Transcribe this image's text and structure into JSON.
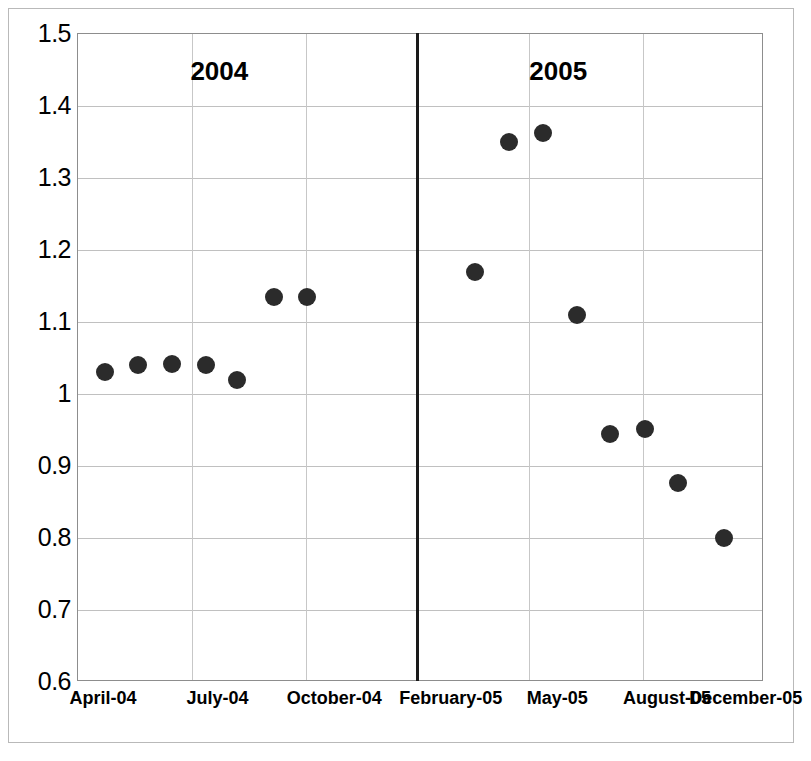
{
  "chart_data": {
    "type": "scatter",
    "title": "",
    "subtitle": "",
    "xlabel": "",
    "ylabel": "",
    "ylim": [
      0.6,
      1.5
    ],
    "ytick_step": 0.1,
    "yticks": [
      "1.5",
      "1.4",
      "1.3",
      "1.2",
      "1.1",
      "1",
      "0.9",
      "0.8",
      "0.7",
      "0.6"
    ],
    "ytick_values": [
      1.5,
      1.4,
      1.3,
      1.2,
      1.1,
      1.0,
      0.9,
      0.8,
      0.7,
      0.6
    ],
    "xticks": [
      "April-04",
      "July-04",
      "October-04",
      "February-05",
      "May-05",
      "August-05",
      "December-05"
    ],
    "xtick_positions": [
      0.038,
      0.205,
      0.375,
      0.545,
      0.7,
      0.86,
      0.975
    ],
    "grid": true,
    "legend": false,
    "legend_position": "none",
    "series": [
      {
        "name": "series-1",
        "x": [
          "April-04",
          "May-04",
          "June-04",
          "July-04",
          "August-04",
          "September-04",
          "October-04",
          "March-05",
          "April-05",
          "May-05",
          "June-05",
          "July-05",
          "August-05",
          "October-05",
          "December-05"
        ],
        "values": [
          1.03,
          1.04,
          1.042,
          1.04,
          1.02,
          1.135,
          1.135,
          1.17,
          1.35,
          1.362,
          1.11,
          0.945,
          0.952,
          0.877,
          0.8
        ],
        "x_fraction": [
          0.04,
          0.088,
          0.137,
          0.187,
          0.232,
          0.285,
          0.334,
          0.578,
          0.628,
          0.678,
          0.727,
          0.776,
          0.826,
          0.875,
          0.942
        ],
        "color": "#2b2b2b",
        "marker": "circle"
      }
    ],
    "annotations": [
      {
        "text": "2004",
        "x_fraction": 0.206,
        "y_value": 1.445,
        "bold": true
      },
      {
        "text": "2005",
        "x_fraction": 0.7,
        "y_value": 1.445,
        "bold": true
      }
    ],
    "era_divider": {
      "x_fraction": 0.4925,
      "color": "#1a1a1a",
      "width_px": 3
    },
    "vertical_gridline_fractions": [
      0.166,
      0.332,
      0.4925,
      0.658,
      0.824
    ],
    "colors": {
      "marker": "#2b2b2b",
      "grid": "#c0c0c0",
      "axis": "#8d8d8d",
      "frame": "#b9b9b9",
      "divider": "#1a1a1a",
      "background": "#ffffff"
    }
  }
}
